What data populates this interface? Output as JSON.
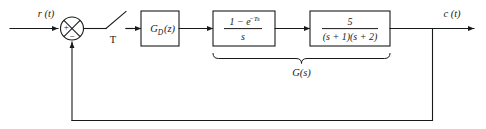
{
  "diagram": {
    "type": "control-system-block-diagram",
    "line_color": "#1a1a1a",
    "background": "#ffffff",
    "signals": {
      "input_label": "r (t)",
      "output_label": "c (t)",
      "sampler_label": "T"
    },
    "summing_junction": {
      "name": "summing-junction",
      "positive_sign": "+",
      "negative_sign": "−",
      "positive_input": "r (t)",
      "negative_input": "feedback"
    },
    "sampler": {
      "name": "sampler-switch",
      "label": "T",
      "description": "ideal sampler, period T"
    },
    "blocks": [
      {
        "id": "controller",
        "name": "digital-controller-block",
        "label": "G",
        "label_sub": "D",
        "label_arg": "(z)",
        "full_text": "G_D (z)"
      },
      {
        "id": "zoh",
        "name": "zero-order-hold-block",
        "numerator": "1 − e",
        "numerator_exp": "−Ts",
        "denominator": "s",
        "full_text": "(1 − e^{−Ts}) / s"
      },
      {
        "id": "plant",
        "name": "plant-transfer-function-block",
        "numerator": "5",
        "denominator": "(s + 1)(s + 2)",
        "full_text": "5 / ((s + 1)(s + 2))"
      }
    ],
    "group_brace": {
      "name": "g-of-s-brace",
      "label": "G(s)",
      "spans": [
        "zoh",
        "plant"
      ]
    },
    "feedback": {
      "name": "feedback-path",
      "description": "unity feedback from output takeoff to summing junction negative input"
    }
  }
}
